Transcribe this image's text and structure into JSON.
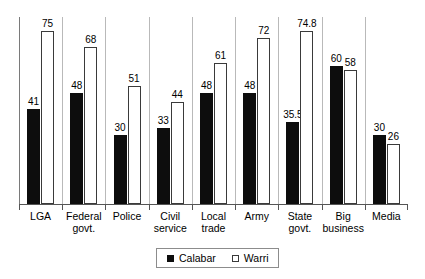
{
  "chart_data": {
    "type": "bar",
    "title": "",
    "xlabel": "",
    "ylabel": "",
    "ylim": [
      0,
      81
    ],
    "grid": false,
    "legend_position": "bottom",
    "categories": [
      "LGA",
      "Federal govt.",
      "Police",
      "Civil service",
      "Local trade",
      "Army",
      "State govt.",
      "Big business",
      "Media"
    ],
    "category_lines": [
      [
        "LGA"
      ],
      [
        "Federal",
        "govt."
      ],
      [
        "Police"
      ],
      [
        "Civil",
        "service"
      ],
      [
        "Local",
        "trade"
      ],
      [
        "Army"
      ],
      [
        "State",
        "govt."
      ],
      [
        "Big",
        "business"
      ],
      [
        "Media"
      ]
    ],
    "series": [
      {
        "name": "Calabar",
        "color": "#0d0d0d",
        "style": "filled",
        "values": [
          41,
          48,
          30,
          33,
          48,
          48,
          35.5,
          60,
          30
        ],
        "labels": [
          "41",
          "48",
          "30",
          "33",
          "48",
          "48",
          "35.5",
          "60",
          "30"
        ]
      },
      {
        "name": "Warri",
        "color": "#ffffff",
        "style": "hollow",
        "values": [
          75,
          68,
          51,
          44,
          61,
          72,
          74.8,
          58,
          26
        ],
        "labels": [
          "75",
          "68",
          "51",
          "44",
          "61",
          "72",
          "74.8",
          "58",
          "26"
        ]
      }
    ]
  },
  "legend": {
    "items": [
      {
        "label": "Calabar",
        "swatch": "filled-square-icon"
      },
      {
        "label": "Warri",
        "swatch": "hollow-square-icon"
      }
    ]
  }
}
